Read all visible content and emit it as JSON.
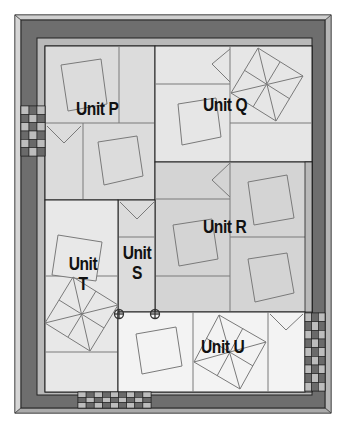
{
  "diagram": {
    "colors": {
      "outer_bevel": "#c8c8c8",
      "border_dark": "#6e6e6e",
      "inner_strip": "#b9b9b9",
      "unit_medium": "#d4d4d4",
      "unit_light": "#e6e6e6",
      "unit_white": "#f3f3f3",
      "line_dark": "#222222",
      "line_medium": "#7a7a7a",
      "check_light": "#bdbdbd",
      "check_dark": "#6a6a6a"
    },
    "units": [
      {
        "id": "P",
        "label": "Unit P"
      },
      {
        "id": "Q",
        "label": "Unit Q"
      },
      {
        "id": "R",
        "label": "Unit R"
      },
      {
        "id": "S",
        "label_line1": "Unit",
        "label_line2": "S"
      },
      {
        "id": "T",
        "label_line1": "Unit",
        "label_line2": "T"
      },
      {
        "id": "U",
        "label": "Unit U"
      }
    ],
    "checkerboards": [
      {
        "position": "left-border",
        "rows": 6,
        "cols": 3
      },
      {
        "position": "bottom-border",
        "rows": 3,
        "cols": 9
      },
      {
        "position": "right-border",
        "rows": 9,
        "cols": 3
      }
    ],
    "markers": [
      {
        "type": "circle-crosshair",
        "position": "S-T-U junction left"
      },
      {
        "type": "circle-crosshair",
        "position": "S-R-U junction right"
      }
    ]
  }
}
